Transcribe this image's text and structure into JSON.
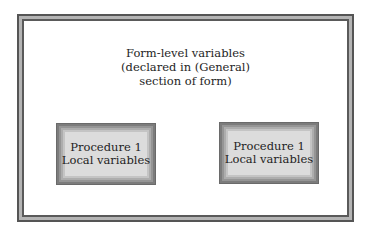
{
  "diagram": {
    "form_scope": {
      "title_lines": [
        "Form-level variables",
        "(declared in (General)",
        "section of form)"
      ]
    },
    "procedures": [
      {
        "name": "Procedure 1",
        "label": "Local variables"
      },
      {
        "name": "Procedure 1",
        "label": "Local variables"
      }
    ]
  },
  "colors": {
    "frame_dark": "#555555",
    "frame_light": "#b4b4b4",
    "box_fill": "#dcdcdc",
    "box_edge": "#6a6a6a",
    "text": "#1e1e1e"
  }
}
